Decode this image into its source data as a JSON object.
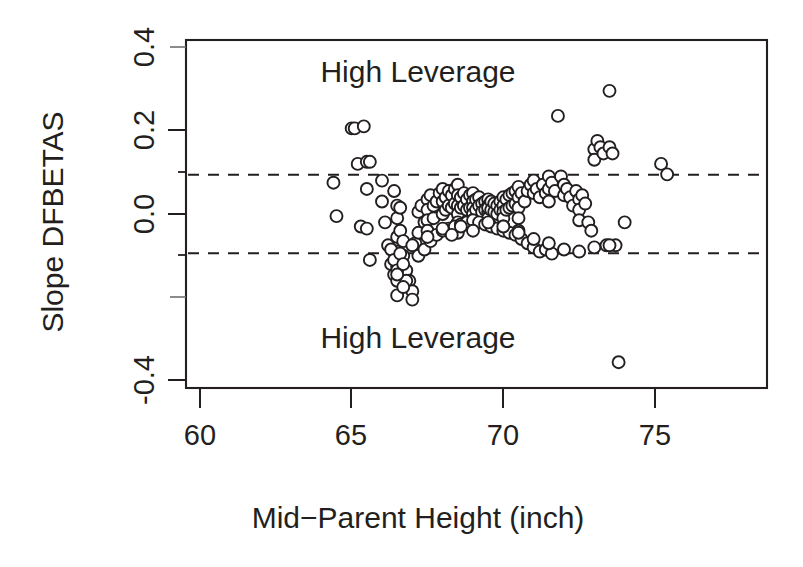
{
  "chart_data": {
    "type": "scatter",
    "title": "",
    "xlabel": "Mid−Parent Height (inch)",
    "ylabel": "Slope DFBETAS",
    "xlim": [
      58.3,
      76.5
    ],
    "ylim": [
      -0.44,
      0.435
    ],
    "xticks": [
      60,
      65,
      70,
      75
    ],
    "xtick_labels": [
      "60",
      "65",
      "70",
      "75"
    ],
    "yticks": [
      -0.4,
      -0.2,
      0.0,
      0.2,
      0.4
    ],
    "ytick_labels": [
      "-0.4",
      "-0.2",
      "0.0",
      "0.2",
      "0.4"
    ],
    "ytick_labels_shown": [
      "-0.4",
      "0.0",
      "0.2",
      "0.4"
    ],
    "yminor_ticks": [
      -0.3,
      -0.1,
      0.1,
      0.3
    ],
    "grid": false,
    "legend": null,
    "marker": "open-circle",
    "marker_size": 6,
    "marker_fill": "#ffffff",
    "marker_stroke": "#231f20",
    "threshold_lines": {
      "style": "dashed",
      "color": "#231f20",
      "values": [
        0.094,
        -0.094
      ]
    },
    "annotations": [
      {
        "text": "High Leverage",
        "x": 67.9,
        "y": 0.345
      },
      {
        "text": "High Leverage",
        "x": 67.9,
        "y": -0.325
      }
    ],
    "x": [
      64.4,
      64.5,
      65.0,
      65.1,
      65.2,
      65.3,
      65.4,
      65.5,
      65.5,
      65.6,
      66.0,
      66.1,
      66.2,
      66.3,
      66.4,
      66.4,
      66.5,
      66.5,
      66.5,
      66.5,
      66.5,
      66.5,
      66.5,
      66.6,
      66.6,
      66.7,
      66.7,
      66.8,
      66.9,
      67.0,
      67.0,
      67.1,
      67.2,
      67.2,
      67.3,
      67.4,
      67.5,
      67.5,
      67.5,
      67.5,
      67.6,
      67.7,
      67.7,
      67.8,
      67.9,
      68.0,
      68.0,
      68.0,
      68.1,
      68.1,
      68.2,
      68.2,
      68.3,
      68.3,
      68.4,
      68.4,
      68.5,
      68.5,
      68.5,
      68.5,
      68.5,
      68.5,
      68.6,
      68.6,
      68.7,
      68.7,
      68.8,
      68.8,
      68.9,
      68.9,
      69.0,
      69.0,
      69.0,
      69.0,
      69.0,
      69.1,
      69.1,
      69.2,
      69.2,
      69.3,
      69.3,
      69.4,
      69.4,
      69.5,
      69.5,
      69.5,
      69.5,
      69.5,
      69.5,
      69.6,
      69.6,
      69.7,
      69.7,
      69.8,
      69.8,
      69.9,
      69.9,
      70.0,
      70.0,
      70.0,
      70.0,
      70.0,
      70.1,
      70.1,
      70.2,
      70.2,
      70.3,
      70.3,
      70.4,
      70.4,
      70.5,
      70.5,
      70.5,
      70.5,
      70.5,
      70.6,
      70.7,
      70.8,
      70.9,
      71.0,
      71.0,
      71.1,
      71.2,
      71.3,
      71.4,
      71.5,
      71.5,
      71.5,
      71.6,
      71.7,
      71.8,
      71.9,
      72.0,
      72.0,
      72.1,
      72.2,
      72.3,
      72.4,
      72.5,
      72.5,
      72.5,
      72.6,
      72.7,
      72.8,
      72.9,
      73.0,
      73.0,
      73.1,
      73.2,
      73.3,
      73.4,
      73.5,
      73.5,
      73.6,
      73.7,
      73.8,
      74.0,
      75.2,
      75.4,
      66.3,
      66.4,
      66.5,
      66.6,
      66.7,
      66.8,
      67.0,
      67.2,
      67.4,
      67.6,
      67.8,
      68.0,
      68.2,
      68.4,
      68.6,
      68.8,
      69.0,
      69.2,
      69.4,
      69.6,
      69.8,
      70.0,
      70.2,
      70.4,
      70.6,
      70.8,
      71.0,
      71.2,
      71.4,
      71.6,
      65.5,
      65.6,
      66.0,
      66.5,
      66.7,
      67.5,
      68.0,
      68.3,
      68.6,
      69.0,
      69.5,
      70.0,
      70.5,
      71.0,
      71.5,
      72.0,
      72.5,
      73.0,
      73.5
    ],
    "y": [
      0.075,
      -0.005,
      0.205,
      0.205,
      0.12,
      -0.03,
      0.21,
      0.06,
      -0.035,
      -0.11,
      0.03,
      -0.02,
      -0.075,
      -0.12,
      -0.145,
      0.055,
      0.02,
      -0.01,
      -0.055,
      -0.09,
      -0.125,
      -0.16,
      -0.195,
      0.015,
      -0.04,
      -0.065,
      -0.1,
      -0.135,
      -0.16,
      -0.185,
      -0.205,
      -0.07,
      -0.045,
      0.005,
      0.02,
      -0.02,
      0.035,
      0.01,
      -0.015,
      -0.04,
      0.045,
      0.02,
      -0.01,
      0.03,
      0.05,
      0.06,
      0.03,
      0.0,
      0.04,
      0.01,
      0.055,
      0.02,
      0.045,
      0.015,
      0.06,
      0.025,
      0.07,
      0.045,
      0.02,
      0.0,
      -0.02,
      -0.045,
      0.04,
      0.015,
      0.05,
      0.02,
      0.035,
      0.01,
      0.045,
      0.015,
      0.05,
      0.03,
      0.015,
      0.0,
      -0.015,
      0.035,
      0.01,
      0.04,
      0.02,
      0.025,
      0.005,
      0.03,
      0.01,
      0.035,
      0.02,
      0.005,
      -0.01,
      -0.025,
      0.015,
      0.03,
      0.01,
      0.025,
      0.005,
      0.02,
      0.0,
      0.03,
      0.01,
      0.04,
      0.02,
      0.005,
      -0.01,
      -0.03,
      0.035,
      0.01,
      0.045,
      0.015,
      0.05,
      0.02,
      0.055,
      0.025,
      0.065,
      0.04,
      0.015,
      -0.01,
      -0.04,
      0.05,
      0.03,
      0.055,
      0.07,
      0.08,
      0.05,
      0.06,
      0.04,
      0.07,
      0.05,
      0.09,
      0.06,
      0.03,
      0.075,
      0.055,
      0.235,
      0.09,
      0.07,
      0.045,
      0.06,
      0.04,
      0.02,
      0.055,
      0.035,
      0.01,
      -0.015,
      0.045,
      0.025,
      -0.02,
      -0.04,
      0.155,
      0.13,
      0.175,
      0.16,
      0.145,
      -0.075,
      0.295,
      0.16,
      0.145,
      -0.075,
      -0.355,
      -0.02,
      0.12,
      0.095,
      -0.085,
      -0.11,
      -0.135,
      -0.095,
      -0.12,
      -0.16,
      -0.075,
      -0.1,
      -0.085,
      -0.065,
      -0.05,
      -0.04,
      -0.035,
      -0.03,
      -0.025,
      -0.02,
      -0.015,
      -0.02,
      -0.025,
      -0.03,
      -0.035,
      -0.04,
      -0.045,
      -0.05,
      -0.06,
      -0.07,
      -0.08,
      -0.09,
      -0.085,
      -0.095,
      0.125,
      0.125,
      0.08,
      -0.145,
      -0.175,
      -0.055,
      -0.035,
      -0.05,
      -0.03,
      -0.04,
      -0.02,
      -0.03,
      -0.045,
      -0.06,
      -0.07,
      -0.085,
      -0.09,
      -0.08,
      -0.075
    ]
  },
  "axis": {
    "x_title": "Mid−Parent Height (inch)",
    "y_title": "Slope DFBETAS",
    "x_tick_labels": [
      "60",
      "65",
      "70",
      "75"
    ],
    "y_tick_labels": [
      "0.4",
      "0.2",
      "0.0",
      "-0.4"
    ]
  },
  "labels": {
    "upper_region": "High Leverage",
    "lower_region": "High Leverage"
  },
  "colors": {
    "ink": "#231f20",
    "background": "#ffffff",
    "marker_fill": "#ffffff"
  }
}
